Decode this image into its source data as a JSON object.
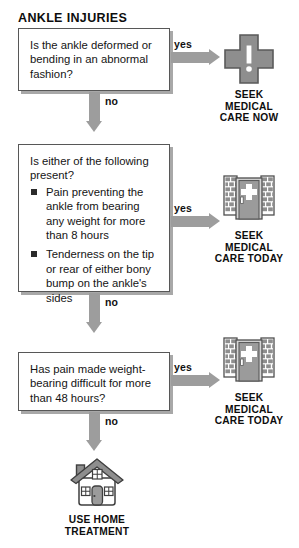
{
  "title": "ANKLE INJURIES",
  "flow": {
    "steps": [
      {
        "id": "step-1",
        "question": "Is the ankle deformed or bending in an abnormal fashion?",
        "bullets": [],
        "yes_label": "yes",
        "no_label": "no",
        "outcome": {
          "icon": "medical-cross-alert-icon",
          "label": "SEEK\nMEDICAL\nCARE NOW"
        }
      },
      {
        "id": "step-2",
        "question": "Is either of the following present?",
        "bullets": [
          "Pain preventing the ankle from bearing any weight for more than 8 hours",
          "Tenderness on the tip or rear of either bony bump on the ankle's sides"
        ],
        "yes_label": "yes",
        "no_label": "no",
        "outcome": {
          "icon": "clinic-building-icon",
          "label": "SEEK\nMEDICAL\nCARE TODAY"
        }
      },
      {
        "id": "step-3",
        "question": "Has pain made weight-bearing difficult for more than 48 hours?",
        "bullets": [],
        "yes_label": "yes",
        "no_label": "no",
        "outcome": {
          "icon": "clinic-building-icon",
          "label": "SEEK\nMEDICAL\nCARE TODAY"
        }
      }
    ],
    "final_outcome": {
      "icon": "house-home-icon",
      "label": "USE HOME\nTREATMENT"
    }
  },
  "colors": {
    "arrow_gray": "#9d9d9d",
    "icon_gray": "#8c8c8c",
    "icon_dark": "#5f5f5f",
    "box_border": "#575757",
    "box_shadow": "#a8a8a8",
    "text": "#141414",
    "background": "#ffffff"
  }
}
